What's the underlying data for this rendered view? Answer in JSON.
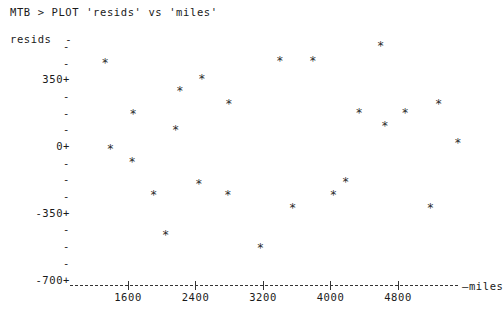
{
  "terminal": {
    "prompt": "MTB >",
    "command_line": "MTB > PLOT 'resids' vs 'miles'"
  },
  "chart_data": {
    "type": "scatter",
    "title": "",
    "xlabel": "miles",
    "ylabel": "resids",
    "marker": "*",
    "grid": false,
    "legend": false,
    "xlim": [
      1000,
      5700
    ],
    "ylim": [
      -700,
      525
    ],
    "xticks": [
      1600,
      2400,
      3200,
      4000,
      4800
    ],
    "xtick_labels": [
      "1600",
      "2400",
      "3200",
      "4000",
      "4800"
    ],
    "yticks": [
      525,
      437,
      350,
      262,
      175,
      87,
      0,
      -87,
      -175,
      -262,
      -350,
      -437,
      -525,
      -612,
      -700
    ],
    "ytick_labels": [
      "-",
      "-",
      "350+",
      "-",
      "-",
      "-",
      "0+",
      "-",
      "-",
      "-",
      "-350+",
      "-",
      "-",
      "-",
      "-700+"
    ],
    "ylabeled_ticks": [
      {
        "value": 350,
        "label": "350+"
      },
      {
        "value": 0,
        "label": "0+"
      },
      {
        "value": -350,
        "label": "-350+"
      },
      {
        "value": -700,
        "label": "-700+"
      }
    ],
    "points": [
      {
        "x": 1330,
        "y": 435
      },
      {
        "x": 1662,
        "y": 165
      },
      {
        "x": 1390,
        "y": -20
      },
      {
        "x": 1650,
        "y": -85
      },
      {
        "x": 2475,
        "y": 350
      },
      {
        "x": 2215,
        "y": 285
      },
      {
        "x": 2795,
        "y": 220
      },
      {
        "x": 2165,
        "y": 80
      },
      {
        "x": 3400,
        "y": 445
      },
      {
        "x": 3790,
        "y": 445
      },
      {
        "x": 4595,
        "y": 520
      },
      {
        "x": 5280,
        "y": 215
      },
      {
        "x": 4340,
        "y": 170
      },
      {
        "x": 4885,
        "y": 170
      },
      {
        "x": 4645,
        "y": 100
      },
      {
        "x": 5510,
        "y": 15
      },
      {
        "x": 2440,
        "y": -200
      },
      {
        "x": 1905,
        "y": -260
      },
      {
        "x": 2785,
        "y": -260
      },
      {
        "x": 4180,
        "y": -190
      },
      {
        "x": 4035,
        "y": -260
      },
      {
        "x": 3550,
        "y": -330
      },
      {
        "x": 5185,
        "y": -330
      },
      {
        "x": 2045,
        "y": -470
      },
      {
        "x": 3170,
        "y": -540
      }
    ]
  }
}
